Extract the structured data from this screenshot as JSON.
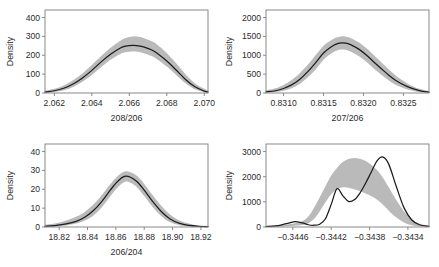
{
  "figure": {
    "type": "multi-panel-density",
    "panels": 4,
    "layout": "2x2",
    "band_color": "#b4b4b4",
    "curve_color": "#1c1c1c",
    "frame_color": "#7d7d7d"
  },
  "chart_data": [
    {
      "type": "area",
      "panel": "top-left",
      "title": "",
      "xlabel": "208/206",
      "ylabel": "Density",
      "xlim": [
        2.0615,
        2.0702
      ],
      "ylim": [
        0,
        440
      ],
      "xticks": [
        2.062,
        2.064,
        2.066,
        2.068,
        2.07
      ],
      "xticklabels": [
        "2.062",
        "2.064",
        "2.066",
        "2.068",
        "2.070"
      ],
      "yticks": [
        0,
        100,
        200,
        300,
        400
      ],
      "yticklabels": [
        "0",
        "100",
        "200",
        "300",
        "400"
      ],
      "grid": false,
      "legend": "none",
      "series": [
        {
          "name": "posterior density",
          "x": [
            2.0615,
            2.062,
            2.0625,
            2.063,
            2.0635,
            2.064,
            2.0645,
            2.065,
            2.0655,
            2.0658,
            2.0662,
            2.0665,
            2.0668,
            2.0672,
            2.0675,
            2.068,
            2.0685,
            2.069,
            2.0695,
            2.07,
            2.0702
          ],
          "values": [
            5,
            12,
            25,
            48,
            80,
            120,
            165,
            205,
            237,
            248,
            252,
            250,
            243,
            228,
            210,
            170,
            122,
            72,
            33,
            10,
            5
          ]
        }
      ],
      "band": {
        "name": "credible interval",
        "x": [
          2.0615,
          2.062,
          2.0625,
          2.063,
          2.0635,
          2.064,
          2.0645,
          2.065,
          2.0655,
          2.0658,
          2.0662,
          2.0665,
          2.0668,
          2.0672,
          2.0675,
          2.068,
          2.0685,
          2.069,
          2.0695,
          2.07,
          2.0702
        ],
        "upper": [
          12,
          22,
          40,
          68,
          104,
          148,
          196,
          240,
          276,
          292,
          300,
          298,
          290,
          274,
          256,
          212,
          158,
          100,
          52,
          22,
          13
        ],
        "lower": [
          1,
          5,
          14,
          32,
          60,
          96,
          138,
          176,
          206,
          216,
          220,
          218,
          210,
          196,
          178,
          140,
          96,
          52,
          20,
          4,
          1
        ]
      }
    },
    {
      "type": "area",
      "panel": "top-right",
      "title": "",
      "xlabel": "207/206",
      "ylabel": "Density",
      "xlim": [
        0.83078,
        0.83282
      ],
      "ylim": [
        0,
        2200
      ],
      "xticks": [
        0.831,
        0.8315,
        0.832,
        0.8325
      ],
      "xticklabels": [
        "0.8310",
        "0.8315",
        "0.8320",
        "0.8325"
      ],
      "yticks": [
        0,
        500,
        1000,
        1500,
        2000
      ],
      "yticklabels": [
        "0",
        "500",
        "1000",
        "1500",
        "2000"
      ],
      "grid": false,
      "legend": "none",
      "series": [
        {
          "name": "posterior density",
          "x": [
            0.83078,
            0.8309,
            0.831,
            0.8311,
            0.8312,
            0.8313,
            0.8314,
            0.8315,
            0.83158,
            0.83165,
            0.83172,
            0.83178,
            0.83185,
            0.83195,
            0.83205,
            0.83215,
            0.83228,
            0.8324,
            0.83255,
            0.8327,
            0.83282
          ],
          "values": [
            30,
            60,
            120,
            215,
            360,
            560,
            800,
            1060,
            1200,
            1290,
            1330,
            1320,
            1270,
            1150,
            980,
            780,
            540,
            340,
            170,
            65,
            25
          ]
        }
      ],
      "band": {
        "name": "credible interval",
        "x": [
          0.83078,
          0.8309,
          0.831,
          0.8311,
          0.8312,
          0.8313,
          0.8314,
          0.8315,
          0.83158,
          0.83165,
          0.83172,
          0.83178,
          0.83185,
          0.83195,
          0.83205,
          0.83215,
          0.83228,
          0.8324,
          0.83255,
          0.8327,
          0.83282
        ],
        "upper": [
          70,
          125,
          215,
          345,
          520,
          740,
          1000,
          1250,
          1380,
          1465,
          1500,
          1490,
          1445,
          1330,
          1165,
          960,
          700,
          470,
          255,
          110,
          50
        ],
        "lower": [
          10,
          25,
          60,
          125,
          240,
          410,
          625,
          880,
          1020,
          1110,
          1150,
          1140,
          1090,
          970,
          800,
          610,
          390,
          220,
          95,
          25,
          8
        ]
      }
    },
    {
      "type": "area",
      "panel": "bottom-left",
      "title": "",
      "xlabel": "206/204",
      "ylabel": "Density",
      "xlim": [
        18.81,
        18.925
      ],
      "ylim": [
        0,
        44
      ],
      "xticks": [
        18.82,
        18.84,
        18.86,
        18.88,
        18.9,
        18.92
      ],
      "xticklabels": [
        "18.82",
        "18.84",
        "18.86",
        "18.88",
        "18.90",
        "18.92"
      ],
      "yticks": [
        0,
        10,
        20,
        30,
        40
      ],
      "yticklabels": [
        "0",
        "10",
        "20",
        "30",
        "40"
      ],
      "grid": false,
      "legend": "none",
      "series": [
        {
          "name": "posterior density",
          "x": [
            18.81,
            18.818,
            18.825,
            18.832,
            18.838,
            18.844,
            18.85,
            18.856,
            18.861,
            18.866,
            18.87,
            18.875,
            18.88,
            18.886,
            18.892,
            18.898,
            18.905,
            18.912,
            18.918,
            18.925
          ],
          "values": [
            0.4,
            0.8,
            1.6,
            3.0,
            5.2,
            8.6,
            13.5,
            19.5,
            24.0,
            26.8,
            26.5,
            24.0,
            19.5,
            13.5,
            8.2,
            4.4,
            1.9,
            0.8,
            0.4,
            0.2
          ]
        }
      ],
      "band": {
        "name": "credible interval",
        "x": [
          18.81,
          18.818,
          18.825,
          18.832,
          18.838,
          18.844,
          18.85,
          18.856,
          18.861,
          18.866,
          18.87,
          18.875,
          18.88,
          18.886,
          18.892,
          18.898,
          18.905,
          18.912,
          18.918,
          18.925
        ],
        "upper": [
          1.2,
          2.0,
          3.4,
          5.4,
          8.0,
          11.8,
          16.8,
          22.6,
          26.8,
          29.4,
          29.2,
          27.0,
          22.8,
          16.8,
          11.2,
          6.8,
          3.4,
          1.7,
          0.9,
          0.5
        ],
        "lower": [
          0.1,
          0.3,
          0.8,
          1.8,
          3.4,
          6.0,
          10.4,
          16.2,
          20.8,
          23.8,
          23.6,
          21.0,
          16.4,
          10.6,
          5.8,
          2.6,
          0.9,
          0.3,
          0.1,
          0.05
        ]
      }
    },
    {
      "type": "area",
      "panel": "bottom-right",
      "title": "",
      "xlabel": "",
      "ylabel": "Density",
      "xlim": [
        -0.34488,
        -0.34318
      ],
      "ylim": [
        0,
        3300
      ],
      "xticks": [
        -0.3446,
        -0.3442,
        -0.3438,
        -0.3434
      ],
      "xticklabels": [
        "−0.3446",
        "−0.3442",
        "−0.3438",
        "−0.3434"
      ],
      "yticks": [
        0,
        1000,
        2000,
        3000
      ],
      "yticklabels": [
        "0",
        "1000",
        "2000",
        "3000"
      ],
      "grid": false,
      "legend": "none",
      "series": [
        {
          "name": "posterior density",
          "x": [
            -0.34488,
            -0.34478,
            -0.34468,
            -0.34458,
            -0.3445,
            -0.34444,
            -0.34438,
            -0.34432,
            -0.34426,
            -0.3442,
            -0.34414,
            -0.34408,
            -0.34402,
            -0.34396,
            -0.3439,
            -0.34384,
            -0.34378,
            -0.34372,
            -0.34366,
            -0.3436,
            -0.34352,
            -0.34344,
            -0.34336,
            -0.34328,
            -0.34318
          ],
          "values": [
            20,
            40,
            120,
            210,
            160,
            90,
            70,
            110,
            330,
            900,
            1520,
            1250,
            1020,
            1080,
            1350,
            1750,
            2200,
            2640,
            2780,
            2500,
            1600,
            760,
            280,
            90,
            30
          ]
        }
      ],
      "band": {
        "name": "credible interval",
        "x": [
          -0.34488,
          -0.34478,
          -0.34468,
          -0.34458,
          -0.3445,
          -0.34444,
          -0.34438,
          -0.34432,
          -0.34426,
          -0.3442,
          -0.34414,
          -0.34408,
          -0.34402,
          -0.34396,
          -0.3439,
          -0.34384,
          -0.34378,
          -0.34372,
          -0.34366,
          -0.3436,
          -0.34352,
          -0.34344,
          -0.34336,
          -0.34328,
          -0.34318
        ],
        "upper": [
          30,
          50,
          90,
          150,
          240,
          420,
          760,
          1180,
          1620,
          2050,
          2350,
          2580,
          2700,
          2740,
          2710,
          2620,
          2470,
          2260,
          1960,
          1580,
          1060,
          620,
          320,
          130,
          45
        ],
        "lower": [
          5,
          12,
          25,
          45,
          80,
          150,
          320,
          620,
          980,
          1300,
          1500,
          1580,
          1560,
          1500,
          1420,
          1330,
          1220,
          1080,
          880,
          650,
          380,
          180,
          70,
          25,
          8
        ]
      }
    }
  ]
}
